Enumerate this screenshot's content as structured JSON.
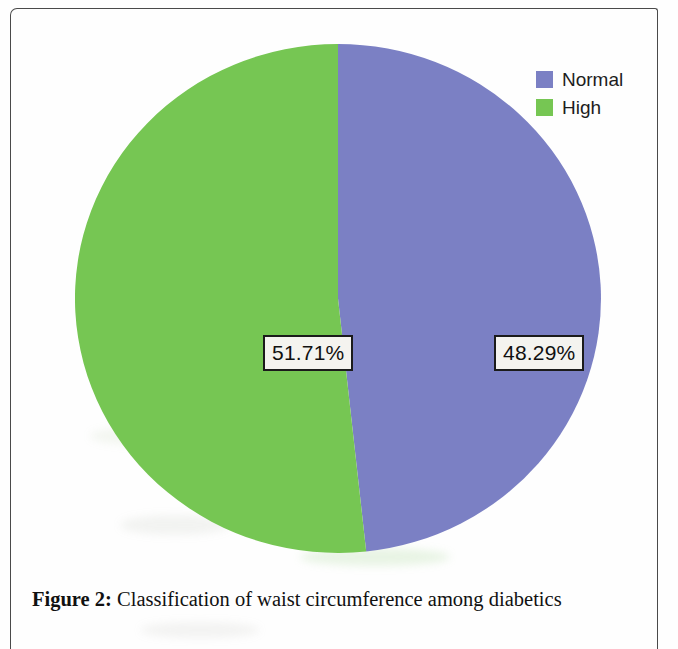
{
  "figure": {
    "caption_label": "Figure 2:",
    "caption_text": " Classification of waist circumference among diabetics"
  },
  "legend": {
    "items": [
      {
        "label": "Normal",
        "color": "#7b80c4"
      },
      {
        "label": "High",
        "color": "#76c653"
      }
    ]
  },
  "labels": {
    "high": "51.71%",
    "normal": "48.29%"
  },
  "colors": {
    "normal": "#7b80c4",
    "high": "#76c653",
    "label_box_border": "#1b1b1b",
    "label_box_fill": "#f4f3ef",
    "page_border": "#4a4a4a",
    "background": "#ffffff"
  },
  "chart_data": {
    "type": "pie",
    "title": "",
    "categories": [
      "Normal",
      "High"
    ],
    "values": [
      48.29,
      51.71
    ],
    "value_unit": "%",
    "data_labels": [
      "48.29%",
      "51.71%"
    ],
    "series": [
      {
        "name": "Classification of waist circumference among diabetics",
        "values": [
          48.29,
          51.71
        ]
      }
    ],
    "slice_colors": [
      "#7b80c4",
      "#76c653"
    ],
    "legend": [
      "Normal",
      "High"
    ],
    "legend_position": "top-right",
    "start_angle_deg": 0,
    "direction": "clockwise",
    "grid": false,
    "xlabel": "",
    "ylabel": ""
  }
}
